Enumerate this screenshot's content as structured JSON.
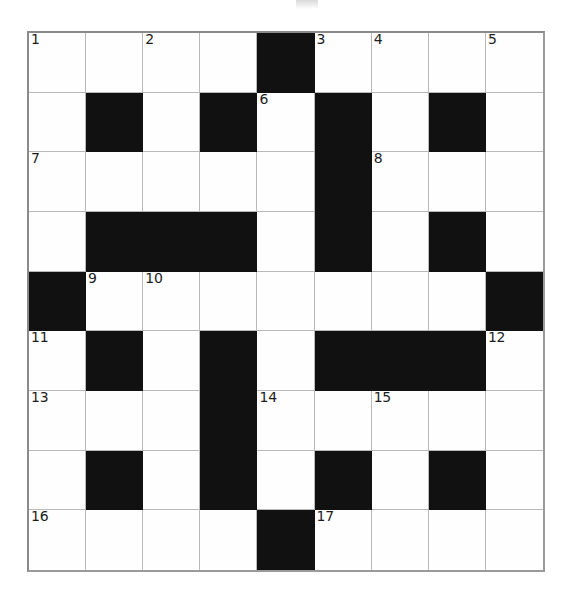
{
  "puzzle": {
    "type": "crossword-grid",
    "title": "",
    "rows": 9,
    "columns": 9,
    "cell_size_px": 57.6,
    "colors": {
      "background": "#ffffff",
      "cell_fill": "#fefefe",
      "block_fill": "#111111",
      "grid_line": "#b9b9b9",
      "outer_border": "#8a8a8a",
      "number_text": "#1d1d1d"
    },
    "legend": {
      "white": "open letter cell",
      "black": "blocked cell"
    },
    "grid": [
      [
        "white",
        "white",
        "white",
        "white",
        "black",
        "white",
        "white",
        "white",
        "white"
      ],
      [
        "white",
        "black",
        "white",
        "black",
        "white",
        "black",
        "white",
        "black",
        "white"
      ],
      [
        "white",
        "white",
        "white",
        "white",
        "white",
        "black",
        "white",
        "white",
        "white"
      ],
      [
        "white",
        "black",
        "black",
        "black",
        "white",
        "black",
        "white",
        "black",
        "white"
      ],
      [
        "black",
        "white",
        "white",
        "white",
        "white",
        "white",
        "white",
        "white",
        "black"
      ],
      [
        "white",
        "black",
        "white",
        "black",
        "white",
        "black",
        "black",
        "black",
        "white"
      ],
      [
        "white",
        "white",
        "white",
        "black",
        "white",
        "white",
        "white",
        "white",
        "white"
      ],
      [
        "white",
        "black",
        "white",
        "black",
        "white",
        "black",
        "white",
        "black",
        "white"
      ],
      [
        "white",
        "white",
        "white",
        "white",
        "black",
        "white",
        "white",
        "white",
        "white"
      ]
    ],
    "numbers": [
      [
        "1",
        "",
        "2",
        "",
        "",
        "3",
        "4",
        "",
        "5"
      ],
      [
        "",
        "",
        "",
        "",
        "6",
        "",
        "",
        "",
        ""
      ],
      [
        "7",
        "",
        "",
        "",
        "",
        "",
        "8",
        "",
        ""
      ],
      [
        "",
        "",
        "",
        "",
        "",
        "",
        "",
        "",
        ""
      ],
      [
        "",
        "9",
        "10",
        "",
        "",
        "",
        "",
        "",
        ""
      ],
      [
        "11",
        "",
        "",
        "",
        "",
        "",
        "",
        "",
        "12"
      ],
      [
        "13",
        "",
        "",
        "",
        "14",
        "",
        "15",
        "",
        ""
      ],
      [
        "",
        "",
        "",
        "",
        "",
        "",
        "",
        "",
        ""
      ],
      [
        "16",
        "",
        "",
        "",
        "",
        "17",
        "",
        "",
        ""
      ]
    ],
    "clue_numbers_visible": [
      "1",
      "2",
      "3",
      "4",
      "5",
      "6",
      "7",
      "8",
      "9",
      "10",
      "11",
      "12",
      "13",
      "14",
      "15",
      "16",
      "17"
    ],
    "entries": {
      "across": [
        {
          "number": "1",
          "row": 1,
          "col": 1,
          "length": 4
        },
        {
          "number": "3",
          "row": 1,
          "col": 6,
          "length": 4
        },
        {
          "number": "7",
          "row": 3,
          "col": 1,
          "length": 5
        },
        {
          "number": "8",
          "row": 3,
          "col": 7,
          "length": 3
        },
        {
          "number": "9",
          "row": 5,
          "col": 2,
          "length": 7
        },
        {
          "number": "13",
          "row": 7,
          "col": 1,
          "length": 3
        },
        {
          "number": "14",
          "row": 7,
          "col": 5,
          "length": 5
        },
        {
          "number": "16",
          "row": 9,
          "col": 1,
          "length": 4
        },
        {
          "number": "17",
          "row": 9,
          "col": 6,
          "length": 4
        }
      ],
      "down": [
        {
          "number": "1",
          "row": 1,
          "col": 1,
          "length": 4
        },
        {
          "number": "2",
          "row": 1,
          "col": 3,
          "length": 3
        },
        {
          "number": "3",
          "row": 1,
          "col": 6,
          "length": 1
        },
        {
          "number": "4",
          "row": 1,
          "col": 7,
          "length": 7
        },
        {
          "number": "5",
          "row": 1,
          "col": 9,
          "length": 4
        },
        {
          "number": "6",
          "row": 2,
          "col": 5,
          "length": 8
        },
        {
          "number": "9",
          "row": 5,
          "col": 2,
          "length": 3
        },
        {
          "number": "10",
          "row": 5,
          "col": 3,
          "length": 5
        },
        {
          "number": "11",
          "row": 6,
          "col": 1,
          "length": 4
        },
        {
          "number": "12",
          "row": 6,
          "col": 9,
          "length": 4
        },
        {
          "number": "15",
          "row": 7,
          "col": 7,
          "length": 3
        }
      ]
    }
  }
}
